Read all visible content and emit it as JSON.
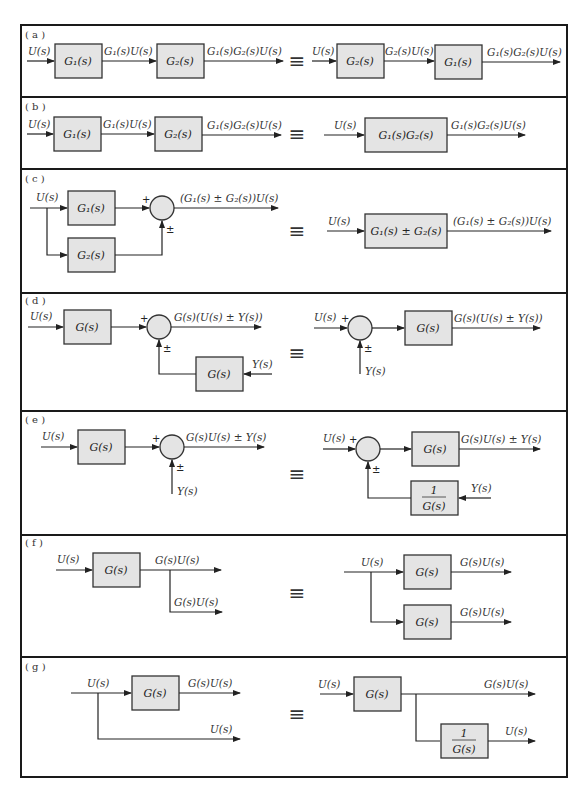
{
  "figure": {
    "equivalence_symbol": "≡",
    "panels": [
      {
        "tag": "( a )",
        "left": {
          "input": "U(s)",
          "blocks": [
            "G₁(s)",
            "G₂(s)"
          ],
          "mid": "G₁(s)U(s)",
          "output": "G₁(s)G₂(s)U(s)"
        },
        "right": {
          "input": "U(s)",
          "blocks": [
            "G₂(s)",
            "G₁(s)"
          ],
          "mid": "G₂(s)U(s)",
          "output": "G₁(s)G₂(s)U(s)"
        }
      },
      {
        "tag": "( b )",
        "left": {
          "input": "U(s)",
          "blocks": [
            "G₁(s)",
            "G₂(s)"
          ],
          "mid": "G₁(s)U(s)",
          "output": "G₁(s)G₂(s)U(s)"
        },
        "right": {
          "input": "U(s)",
          "block": "G₁(s)G₂(s)",
          "output": "G₁(s)G₂(s)U(s)"
        }
      },
      {
        "tag": "( c )",
        "left": {
          "input": "U(s)",
          "blocks": [
            "G₁(s)",
            "G₂(s)"
          ],
          "sign_top": "+",
          "sign_bottom": "±",
          "output": "(G₁(s) ± G₂(s))U(s)"
        },
        "right": {
          "input": "U(s)",
          "block": "G₁(s) ± G₂(s)",
          "output": "(G₁(s) ± G₂(s))U(s)"
        }
      },
      {
        "tag": "( d )",
        "left": {
          "input": "U(s)",
          "block": "G(s)",
          "feedback_block": "G(s)",
          "feedback_input": "Y(s)",
          "sign_top": "+",
          "sign_bottom": "±",
          "output": "G(s)(U(s) ± Y(s))"
        },
        "right": {
          "input": "U(s)",
          "sign_top": "+",
          "sign_bottom": "±",
          "side_input": "Y(s)",
          "block": "G(s)",
          "output": "G(s)(U(s) ± Y(s))"
        }
      },
      {
        "tag": "( e )",
        "left": {
          "input": "U(s)",
          "block": "G(s)",
          "sign_top": "+",
          "sign_bottom": "±",
          "side_input": "Y(s)",
          "output": "G(s)U(s) ± Y(s)"
        },
        "right": {
          "input": "U(s)",
          "sign_top": "+",
          "sign_bottom": "±",
          "block": "G(s)",
          "feedback_block_num": "1",
          "feedback_block_den": "G(s)",
          "feedback_input": "Y(s)",
          "output": "G(s)U(s) ± Y(s)"
        }
      },
      {
        "tag": "( f )",
        "left": {
          "input": "U(s)",
          "block": "G(s)",
          "output_top": "G(s)U(s)",
          "output_bottom": "G(s)U(s)"
        },
        "right": {
          "input": "U(s)",
          "blocks": [
            "G(s)",
            "G(s)"
          ],
          "output_top": "G(s)U(s)",
          "output_bottom": "G(s)U(s)"
        }
      },
      {
        "tag": "( g )",
        "left": {
          "input": "U(s)",
          "block": "G(s)",
          "output_top": "G(s)U(s)",
          "output_bottom": "U(s)"
        },
        "right": {
          "input": "U(s)",
          "block": "G(s)",
          "branch_block_num": "1",
          "branch_block_den": "G(s)",
          "output_top": "G(s)U(s)",
          "output_bottom": "U(s)"
        }
      }
    ]
  },
  "colors": {
    "block_fill": "#e4e4e4",
    "stroke": "#222222",
    "frame": "#1a1a1a"
  }
}
